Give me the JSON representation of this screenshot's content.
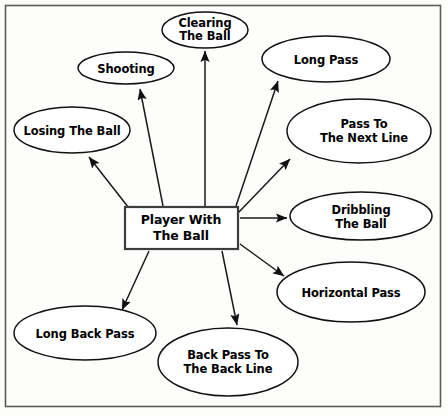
{
  "diagram": {
    "type": "radial-concept-map",
    "frame": {
      "color": "#5a5a58"
    },
    "central_node": {
      "label_line_1": "Player With",
      "label_line_2": "The Ball",
      "shape": "rectangle",
      "x": 125,
      "y": 207,
      "width": 113,
      "height": 42,
      "border_color": "#3d3d3d",
      "fill_color": "#ffffff"
    },
    "nodes": [
      {
        "id": "clearing-the-ball",
        "label_line_1": "Clearing",
        "label_line_2": "The Ball",
        "shape": "ellipse",
        "cx": 205,
        "cy": 30,
        "rx": 43,
        "ry": 18
      },
      {
        "id": "shooting",
        "label_line_1": "Shooting",
        "label_line_2": "",
        "shape": "ellipse",
        "cx": 126,
        "cy": 68,
        "rx": 48,
        "ry": 16
      },
      {
        "id": "losing-the-ball",
        "label_line_1": "Losing The Ball",
        "label_line_2": "",
        "shape": "ellipse",
        "cx": 72,
        "cy": 130,
        "rx": 58,
        "ry": 23
      },
      {
        "id": "long-pass",
        "label_line_1": "Long Pass",
        "label_line_2": "",
        "shape": "ellipse",
        "cx": 326,
        "cy": 59,
        "rx": 64,
        "ry": 23
      },
      {
        "id": "pass-to-the-next-line",
        "label_line_1": "Pass To",
        "label_line_2": "The Next Line",
        "shape": "ellipse",
        "cx": 359,
        "cy": 131,
        "rx": 72,
        "ry": 32
      },
      {
        "id": "dribbling-the-ball",
        "label_line_1": "Dribbling",
        "label_line_2": "The Ball",
        "shape": "ellipse",
        "cx": 361,
        "cy": 216,
        "rx": 71,
        "ry": 24
      },
      {
        "id": "horizontal-pass",
        "label_line_1": "Horizontal Pass",
        "label_line_2": "",
        "shape": "ellipse",
        "cx": 351,
        "cy": 292,
        "rx": 74,
        "ry": 30
      },
      {
        "id": "back-pass-to-the-back-line",
        "label_line_1": "Back Pass To",
        "label_line_2": "The Back Line",
        "shape": "ellipse",
        "cx": 228,
        "cy": 362,
        "rx": 70,
        "ry": 34
      },
      {
        "id": "long-back-pass",
        "label_line_1": "Long Back Pass",
        "label_line_2": "",
        "shape": "ellipse",
        "cx": 85,
        "cy": 333,
        "rx": 71,
        "ry": 27
      }
    ],
    "edges": [
      {
        "from": "player-with-the-ball",
        "to": "clearing-the-ball"
      },
      {
        "from": "player-with-the-ball",
        "to": "shooting"
      },
      {
        "from": "player-with-the-ball",
        "to": "losing-the-ball"
      },
      {
        "from": "player-with-the-ball",
        "to": "long-pass"
      },
      {
        "from": "player-with-the-ball",
        "to": "pass-to-the-next-line"
      },
      {
        "from": "player-with-the-ball",
        "to": "dribbling-the-ball"
      },
      {
        "from": "player-with-the-ball",
        "to": "horizontal-pass"
      },
      {
        "from": "player-with-the-ball",
        "to": "back-pass-to-the-back-line"
      },
      {
        "from": "player-with-the-ball",
        "to": "long-back-pass"
      }
    ]
  }
}
